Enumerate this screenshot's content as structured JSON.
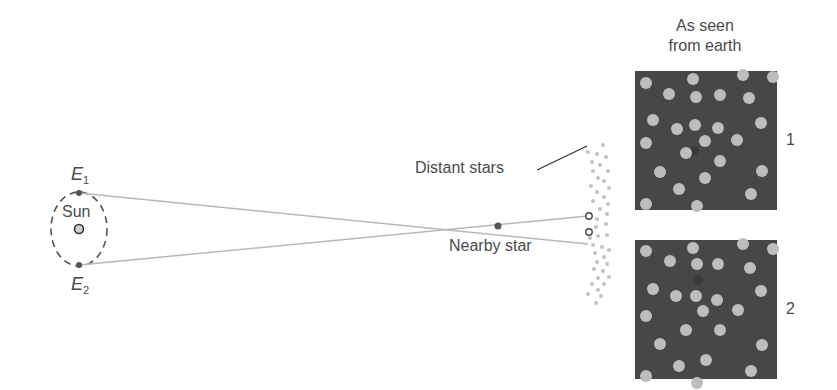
{
  "labels": {
    "sun": "Sun",
    "e1_letter": "E",
    "e1_sub": "1",
    "e2_letter": "E",
    "e2_sub": "2",
    "nearby_star": "Nearby star",
    "distant_stars": "Distant stars",
    "as_seen_line1": "As seen",
    "as_seen_line2": "from earth",
    "panel1_number": "1",
    "panel2_number": "2"
  },
  "colors": {
    "panel_bg": "#474747",
    "star_dot": "#bdbdbd",
    "sight_line": "#b8b8b8",
    "orbit": "#555555"
  }
}
